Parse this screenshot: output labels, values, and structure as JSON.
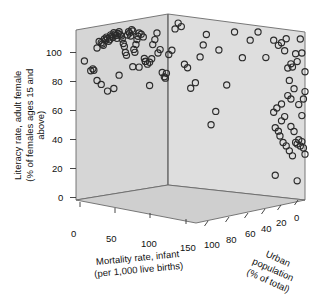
{
  "chart_data": {
    "type": "scatter",
    "projection": "3d",
    "title": "",
    "xlabel": "Mortality rate, infant (per 1,000 live births)",
    "ylabel": "Literacy rate, adult female (% of females ages 15 and above)",
    "zlabel": "Urban population (% of total)",
    "xlabel_lines": [
      "Mortality rate, infant",
      "(per 1,000 live births)"
    ],
    "ylabel_lines": [
      "Literacy rate, adult female",
      "(% of females ages 15 and",
      "above)"
    ],
    "zlabel_lines": [
      "Urban",
      "population",
      "(% of total)"
    ],
    "xlim": [
      0,
      175
    ],
    "ylim": [
      0,
      110
    ],
    "zlim": [
      100,
      0
    ],
    "xticks": [
      0,
      50,
      100,
      150
    ],
    "yticks": [
      0,
      20,
      40,
      60,
      80,
      100
    ],
    "zticks": [
      100,
      80,
      60,
      40,
      20,
      0
    ],
    "xtick_labels": [
      "0",
      "50",
      "100",
      "150"
    ],
    "ytick_labels": [
      "0",
      "20",
      "40",
      "60",
      "80",
      "100"
    ],
    "ztick_labels": [
      "100",
      "80",
      "60",
      "40",
      "20",
      "0"
    ],
    "grid": false,
    "legend": null,
    "marker": "open-circle",
    "marker_color": "#2b2b2b",
    "marker_fill": "none",
    "marker_size": 3.1,
    "panel_back_left_color": "#d6d6d6",
    "panel_back_right_color": "#dedede",
    "panel_floor_color": "#cfcfcf",
    "panel_edge_color": "#6a6a6a",
    "n_points": 132,
    "points": [
      [
        8,
        89,
        22
      ],
      [
        14,
        82,
        26
      ],
      [
        16,
        83,
        30
      ],
      [
        17,
        82,
        31
      ],
      [
        20,
        96,
        44
      ],
      [
        22,
        100,
        38
      ],
      [
        24,
        99,
        35
      ],
      [
        25,
        98,
        41
      ],
      [
        26,
        97,
        33
      ],
      [
        27,
        101,
        46
      ],
      [
        28,
        100,
        49
      ],
      [
        29,
        102,
        45
      ],
      [
        30,
        101,
        43
      ],
      [
        31,
        99,
        37
      ],
      [
        32,
        100,
        52
      ],
      [
        33,
        103,
        48
      ],
      [
        34,
        102,
        50
      ],
      [
        35,
        101,
        55
      ],
      [
        36,
        104,
        47
      ],
      [
        37,
        103,
        44
      ],
      [
        38,
        102,
        42
      ],
      [
        39,
        100,
        39
      ],
      [
        40,
        103,
        58
      ],
      [
        41,
        104,
        53
      ],
      [
        42,
        102,
        56
      ],
      [
        43,
        101,
        51
      ],
      [
        44,
        99,
        40
      ],
      [
        45,
        96,
        36
      ],
      [
        46,
        94,
        34
      ],
      [
        47,
        90,
        29
      ],
      [
        48,
        88,
        32
      ],
      [
        49,
        101,
        60
      ],
      [
        50,
        103,
        62
      ],
      [
        51,
        102,
        59
      ],
      [
        52,
        100,
        57
      ],
      [
        53,
        104,
        63
      ],
      [
        54,
        103,
        61
      ],
      [
        55,
        91,
        28
      ],
      [
        56,
        89,
        27
      ],
      [
        57,
        94,
        43
      ],
      [
        58,
        97,
        45
      ],
      [
        59,
        99,
        48
      ],
      [
        60,
        101,
        54
      ],
      [
        62,
        100,
        50
      ],
      [
        64,
        98,
        46
      ],
      [
        65,
        84,
        25
      ],
      [
        66,
        82,
        24
      ],
      [
        68,
        80,
        23
      ],
      [
        70,
        81,
        21
      ],
      [
        72,
        83,
        20
      ],
      [
        73,
        92,
        41
      ],
      [
        75,
        95,
        47
      ],
      [
        77,
        99,
        52
      ],
      [
        78,
        86,
        30
      ],
      [
        80,
        88,
        33
      ],
      [
        82,
        73,
        18
      ],
      [
        84,
        70,
        17
      ],
      [
        85,
        69,
        16
      ],
      [
        86,
        72,
        19
      ],
      [
        88,
        84,
        26
      ],
      [
        90,
        87,
        31
      ],
      [
        92,
        101,
        57
      ],
      [
        94,
        105,
        65
      ],
      [
        96,
        103,
        60
      ],
      [
        98,
        79,
        22
      ],
      [
        100,
        77,
        20
      ],
      [
        102,
        64,
        14
      ],
      [
        105,
        68,
        15
      ],
      [
        108,
        85,
        28
      ],
      [
        110,
        93,
        40
      ],
      [
        112,
        100,
        55
      ],
      [
        115,
        42,
        10
      ],
      [
        118,
        51,
        12
      ],
      [
        120,
        91,
        38
      ],
      [
        125,
        69,
        16
      ],
      [
        130,
        104,
        64
      ],
      [
        135,
        88,
        34
      ],
      [
        140,
        100,
        58
      ],
      [
        145,
        106,
        66
      ],
      [
        150,
        90,
        36
      ],
      [
        30,
        67,
        15
      ],
      [
        36,
        68,
        16
      ],
      [
        41,
        76,
        19
      ],
      [
        54,
        80,
        23
      ],
      [
        60,
        79,
        22
      ],
      [
        66,
        82,
        24
      ],
      [
        70,
        66,
        14
      ],
      [
        20,
        75,
        20
      ],
      [
        24,
        72,
        18
      ],
      [
        155,
        102,
        92
      ],
      [
        158,
        99,
        88
      ],
      [
        160,
        101,
        85
      ],
      [
        162,
        96,
        82
      ],
      [
        163,
        104,
        78
      ],
      [
        165,
        77,
        74
      ],
      [
        166,
        88,
        72
      ],
      [
        167,
        86,
        70
      ],
      [
        168,
        72,
        68
      ],
      [
        169,
        95,
        66
      ],
      [
        170,
        90,
        64
      ],
      [
        171,
        62,
        62
      ],
      [
        172,
        105,
        60
      ],
      [
        173,
        96,
        58
      ],
      [
        174,
        66,
        56
      ],
      [
        175,
        84,
        54
      ],
      [
        155,
        55,
        52
      ],
      [
        157,
        58,
        50
      ],
      [
        160,
        61,
        48
      ],
      [
        162,
        53,
        46
      ],
      [
        164,
        67,
        44
      ],
      [
        166,
        47,
        42
      ],
      [
        168,
        44,
        40
      ],
      [
        170,
        36,
        38
      ],
      [
        172,
        35,
        36
      ],
      [
        173,
        38,
        34
      ],
      [
        174,
        34,
        32
      ],
      [
        175,
        30,
        30
      ],
      [
        156,
        45,
        28
      ],
      [
        158,
        43,
        26
      ],
      [
        159,
        40,
        24
      ],
      [
        161,
        36,
        22
      ],
      [
        163,
        34,
        20
      ],
      [
        165,
        31,
        18
      ],
      [
        167,
        28,
        16
      ],
      [
        169,
        37,
        14
      ],
      [
        171,
        39,
        12
      ],
      [
        173,
        55,
        10
      ],
      [
        175,
        71,
        8
      ],
      [
        156,
        14,
        6
      ],
      [
        170,
        12,
        4
      ],
      [
        160,
        50,
        5
      ],
      [
        164,
        85,
        3
      ],
      [
        166,
        65,
        2
      ]
    ]
  },
  "axes": {
    "y_ticks": [
      {
        "label": "100",
        "x": 46,
        "y": 47
      },
      {
        "label": "80",
        "x": 52,
        "y": 76
      },
      {
        "label": "60",
        "x": 52,
        "y": 105
      },
      {
        "label": "40",
        "x": 52,
        "y": 134
      },
      {
        "label": "20",
        "x": 52,
        "y": 163
      },
      {
        "label": "0",
        "x": 58,
        "y": 192
      }
    ],
    "x_ticks": [
      {
        "label": "0",
        "x": 71,
        "y": 228
      },
      {
        "label": "50",
        "x": 106,
        "y": 233
      },
      {
        "label": "100",
        "x": 141,
        "y": 238
      },
      {
        "label": "150",
        "x": 180,
        "y": 242
      }
    ],
    "z_ticks": [
      {
        "label": "100",
        "x": 204,
        "y": 239
      },
      {
        "label": "80",
        "x": 226,
        "y": 234
      },
      {
        "label": "60",
        "x": 245,
        "y": 228
      },
      {
        "label": "40",
        "x": 261,
        "y": 223
      },
      {
        "label": "20",
        "x": 276,
        "y": 217
      },
      {
        "label": "0",
        "x": 294,
        "y": 212
      }
    ]
  },
  "geometry": {
    "back_left_panel": "76,30 168,14 168,185 76,200",
    "back_right_panel": "168,14 305,32 305,200 168,185",
    "floor_panel": "76,200 168,185 305,200 196,223",
    "vertical_seam": "168,14 168,185"
  }
}
